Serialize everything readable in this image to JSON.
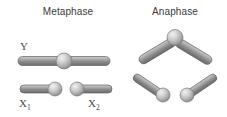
{
  "figure": {
    "background_color": "#ffffff",
    "width": 227,
    "height": 117
  },
  "panels": [
    {
      "id": "metaphase",
      "label": "Metaphase"
    },
    {
      "id": "anaphase",
      "label": "Anaphase"
    }
  ],
  "labels": {
    "metaphase": "Metaphase",
    "anaphase": "Anaphase",
    "y_chromosome": "Y",
    "x1_chromosome_base": "X",
    "x1_chromosome_sub": "1",
    "x2_chromosome_base": "X",
    "x2_chromosome_sub": "2"
  },
  "colors": {
    "background": "#ffffff",
    "text": "#3a3a3a",
    "label_text": "#4a4a4a",
    "rod_light": "#c9c9c9",
    "rod_mid": "#9a9a9a",
    "rod_dark": "#6e6e6e",
    "rod_outline": "#5f5f5f",
    "centromere_light": "#e8e8e8",
    "centromere_mid": "#bdbdbd",
    "centromere_dark": "#8e8e8e",
    "centromere_outline": "#7a7a7a"
  },
  "metaphase_panel": {
    "chromosomes": [
      {
        "name": "Y",
        "type": "metacentric",
        "orientation": "horizontal",
        "centromere_position": "middle",
        "rod": {
          "x1": 18,
          "y1": 61,
          "x2": 110,
          "y2": 61,
          "thickness": 9
        },
        "centromere": {
          "cx": 64,
          "cy": 61,
          "r": 8
        }
      },
      {
        "name": "X1",
        "type": "acrocentric",
        "orientation": "horizontal",
        "centromere_position": "right-end",
        "rod": {
          "x1": 20,
          "y1": 89,
          "x2": 52,
          "y2": 89,
          "thickness": 8
        },
        "centromere": {
          "cx": 55,
          "cy": 89,
          "r": 7
        }
      },
      {
        "name": "X2",
        "type": "acrocentric",
        "orientation": "horizontal",
        "centromere_position": "left-end",
        "rod": {
          "x1": 80,
          "y1": 89,
          "x2": 112,
          "y2": 89,
          "thickness": 8
        },
        "centromere": {
          "cx": 77,
          "cy": 89,
          "r": 7
        }
      }
    ]
  },
  "anaphase_panel": {
    "chromosomes": [
      {
        "name": "Y",
        "type": "metacentric",
        "shape": "chevron",
        "centromere_position": "apex-top",
        "left_arm": {
          "x1": 139,
          "y1": 62,
          "x2": 173,
          "y2": 41,
          "thickness": 9
        },
        "right_arm": {
          "x1": 177,
          "y1": 41,
          "x2": 211,
          "y2": 62,
          "thickness": 9
        },
        "centromere": {
          "cx": 175,
          "cy": 37,
          "r": 8
        }
      },
      {
        "name": "X1",
        "type": "acrocentric",
        "shape": "angled-rod",
        "centromere_position": "lower-right-end",
        "rod": {
          "x1": 133,
          "y1": 73,
          "x2": 160,
          "y2": 92,
          "thickness": 8
        },
        "centromere": {
          "cx": 163,
          "cy": 95,
          "r": 7
        }
      },
      {
        "name": "X2",
        "type": "acrocentric",
        "shape": "angled-rod",
        "centromere_position": "lower-left-end",
        "rod": {
          "x1": 217,
          "y1": 73,
          "x2": 190,
          "y2": 92,
          "thickness": 8
        },
        "centromere": {
          "cx": 187,
          "cy": 95,
          "r": 7
        }
      }
    ]
  }
}
